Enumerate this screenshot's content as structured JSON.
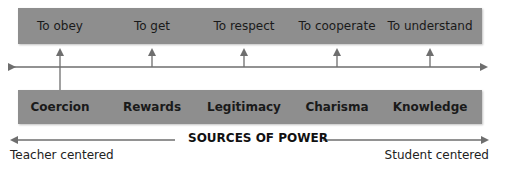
{
  "diagram": {
    "title": "SOURCES OF POWER",
    "left_end_label": "Teacher centered",
    "right_end_label": "Student centered",
    "motivations": [
      {
        "label": "To obey"
      },
      {
        "label": "To get"
      },
      {
        "label": "To respect"
      },
      {
        "label": "To cooperate"
      },
      {
        "label": "To understand"
      }
    ],
    "sources": [
      {
        "label": "Coercion"
      },
      {
        "label": "Rewards"
      },
      {
        "label": "Legitimacy"
      },
      {
        "label": "Charisma"
      },
      {
        "label": "Knowledge"
      }
    ],
    "colors": {
      "box_fill": "#8e8e8e",
      "line": "#6e6e6e",
      "text": "#1a1a1a"
    }
  }
}
